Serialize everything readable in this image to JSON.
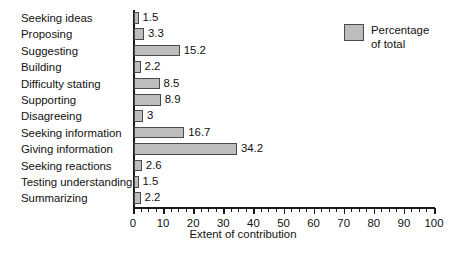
{
  "chart_data": {
    "type": "bar",
    "orientation": "horizontal",
    "title": "",
    "xlabel": "Extent of contribution",
    "ylabel": "",
    "xlim": [
      0,
      100
    ],
    "grid": false,
    "legend_position": "top-right",
    "xticks": [
      0,
      10,
      20,
      30,
      40,
      50,
      60,
      70,
      80,
      90,
      100
    ],
    "xtick_labels": [
      "0",
      "10",
      "20",
      "30",
      "40",
      "50",
      "60",
      "70",
      "80",
      "90",
      "100"
    ],
    "minor_tick_interval": 2.5,
    "categories": [
      "Seeking ideas",
      "Proposing",
      "Suggesting",
      "Building",
      "Difficulty stating",
      "Supporting",
      "Disagreeing",
      "Seeking information",
      "Giving information",
      "Seeking reactions",
      "Testing understanding",
      "Summarizing"
    ],
    "values": [
      1.5,
      3.3,
      15.2,
      2.2,
      8.5,
      8.9,
      3,
      16.7,
      34.2,
      2.6,
      1.5,
      2.2
    ],
    "value_labels": [
      "1.5",
      "3.3",
      "15.2",
      "2.2",
      "8.5",
      "8.9",
      "3",
      "16.7",
      "34.2",
      "2.6",
      "1.5",
      "2.2"
    ],
    "series": [
      {
        "name": "Percentage of total",
        "values": [
          1.5,
          3.3,
          15.2,
          2.2,
          8.5,
          8.9,
          3,
          16.7,
          34.2,
          2.6,
          1.5,
          2.2
        ]
      }
    ],
    "legend": [
      {
        "label": "Percentage\nof total",
        "color": "#bdbdbd"
      }
    ],
    "colors": {
      "bar_fill": "#bdbdbd",
      "bar_edge": "#4a4a4a",
      "axis": "#1a1a1a",
      "text": "#111111",
      "background": "#ffffff"
    }
  }
}
